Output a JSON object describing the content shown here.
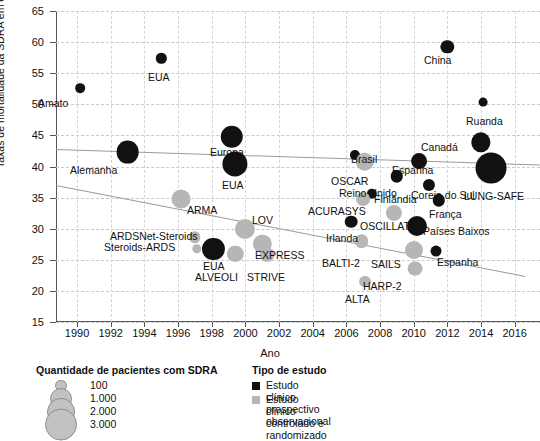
{
  "chart_data": {
    "type": "scatter",
    "title": "",
    "xlabel": "Ano",
    "ylabel": "Taxas de mortalidade da SDRA em estudos clínicos (%)",
    "xlim": [
      1988.75,
      2017.5
    ],
    "ylim": [
      15,
      65
    ],
    "xticks": [
      1990,
      1992,
      1994,
      1996,
      1998,
      2000,
      2002,
      2004,
      2006,
      2008,
      2010,
      2012,
      2014,
      2016
    ],
    "yticks": [
      15,
      20,
      25,
      30,
      35,
      40,
      45,
      50,
      55,
      60,
      65
    ],
    "grid": true,
    "legend_position": "below-plot",
    "size_encoding": "Quantidade de pacientes com SDRA",
    "series": [
      {
        "name": "Estudo clínico prospectivo observacional",
        "color": "#111111",
        "points": [
          {
            "label": "Amato",
            "x": 1990.2,
            "y": 52.6,
            "n": 90,
            "lx": 38,
            "ly": 97
          },
          {
            "label": "EUA",
            "x": 1995.0,
            "y": 57.4,
            "n": 120,
            "lx": 148,
            "ly": 71
          },
          {
            "label": "Alemanha",
            "x": 1993.0,
            "y": 42.3,
            "n": 1400,
            "lx": 70,
            "ly": 164
          },
          {
            "label": "Europa",
            "x": 1999.2,
            "y": 44.8,
            "n": 1350,
            "lx": 210,
            "ly": 146
          },
          {
            "label": "EUA",
            "x": 1999.4,
            "y": 40.4,
            "n": 1800,
            "lx": 222,
            "ly": 179
          },
          {
            "label": "EUA",
            "x": 1998.1,
            "y": 26.7,
            "n": 1300,
            "lx": 203,
            "ly": 260
          },
          {
            "label": "China",
            "x": 2012.0,
            "y": 59.2,
            "n": 300,
            "lx": 424,
            "ly": 54
          },
          {
            "label": "Ruanda",
            "x": 2014.1,
            "y": 50.4,
            "n": 60,
            "lx": 466,
            "ly": 115
          },
          {
            "label": "Canadá",
            "x": 2014.0,
            "y": 43.9,
            "n": 900,
            "lx": 421,
            "ly": 141
          },
          {
            "label": "Brasil",
            "x": 2006.5,
            "y": 41.9,
            "n": 110,
            "lx": 351,
            "ly": 153
          },
          {
            "label": "Espanha",
            "x": 2010.3,
            "y": 40.9,
            "n": 520,
            "lx": 392,
            "ly": 164
          },
          {
            "label": "Reino Unido",
            "x": 2009.0,
            "y": 38.4,
            "n": 240,
            "lx": 339,
            "ly": 187
          },
          {
            "label": "Coreia do Sul",
            "x": 2010.9,
            "y": 37.0,
            "n": 220,
            "lx": 411,
            "ly": 189
          },
          {
            "label": "LUNG-SAFE",
            "x": 2014.6,
            "y": 39.8,
            "n": 3000,
            "lx": 464,
            "ly": 190
          },
          {
            "label": "Finlândia",
            "x": 2007.5,
            "y": 35.6,
            "n": 120,
            "lx": 374,
            "ly": 193
          },
          {
            "label": "França",
            "x": 2011.5,
            "y": 34.6,
            "n": 240,
            "lx": 429,
            "ly": 208
          },
          {
            "label": "Irlanda",
            "x": 2006.3,
            "y": 31.1,
            "n": 250,
            "lx": 326,
            "ly": 232
          },
          {
            "label": "Países Baixos",
            "x": 2010.2,
            "y": 30.5,
            "n": 1000,
            "lx": 423,
            "ly": 225
          },
          {
            "label": "Espanha",
            "x": 2011.3,
            "y": 26.4,
            "n": 150,
            "lx": 437,
            "ly": 256
          }
        ]
      },
      {
        "name": "Estudo clínico controlado e randomizado",
        "color": "#b6b6b6",
        "points": [
          {
            "label": "ARMA",
            "x": 1996.2,
            "y": 34.8,
            "n": 860,
            "lx": 187,
            "ly": 204
          },
          {
            "label": "ARDSNet-Steroids",
            "x": 1997.0,
            "y": 28.6,
            "n": 180,
            "lx": 110,
            "ly": 230
          },
          {
            "label": "Steroids-ARDS",
            "x": 1997.1,
            "y": 26.8,
            "n": 80,
            "lx": 104,
            "ly": 241
          },
          {
            "label": "LOV",
            "x": 2000.0,
            "y": 30.0,
            "n": 1000,
            "lx": 252,
            "ly": 214
          },
          {
            "label": "ALVEOLI",
            "x": 1999.4,
            "y": 26.0,
            "n": 560,
            "lx": 195,
            "ly": 271
          },
          {
            "label": "EXPRESS",
            "x": 2001.0,
            "y": 27.6,
            "n": 780,
            "lx": 255,
            "ly": 249
          },
          {
            "label": "STRIVE",
            "x": 2001.3,
            "y": 25.8,
            "n": 400,
            "lx": 247,
            "ly": 271
          },
          {
            "label": "OSCAR",
            "x": 2007.1,
            "y": 40.8,
            "n": 800,
            "lx": 331,
            "ly": 175
          },
          {
            "label": "ACURASYS",
            "x": 2007.0,
            "y": 34.7,
            "n": 340,
            "lx": 308,
            "ly": 205
          },
          {
            "label": "OSCILLATE",
            "x": 2008.8,
            "y": 32.5,
            "n": 550,
            "lx": 360,
            "ly": 220
          },
          {
            "label": "BALTI-2",
            "x": 2006.9,
            "y": 28.0,
            "n": 330,
            "lx": 322,
            "ly": 257
          },
          {
            "label": "SAILS",
            "x": 2010.0,
            "y": 26.5,
            "n": 740,
            "lx": 371,
            "ly": 258
          },
          {
            "label": "HARP-2",
            "x": 2010.1,
            "y": 23.6,
            "n": 420,
            "lx": 363,
            "ly": 280
          },
          {
            "label": "ALTA",
            "x": 2007.1,
            "y": 21.5,
            "n": 200,
            "lx": 345,
            "ly": 293
          }
        ]
      }
    ],
    "trend_lines": [
      {
        "name": "observational-trend",
        "x1": 1988.75,
        "y1": 42.8,
        "x2": 2017.5,
        "y2": 40.3
      },
      {
        "name": "rct-trend",
        "x1": 1988.75,
        "y1": 37.0,
        "x2": 2016.6,
        "y2": 22.4
      }
    ]
  },
  "axes": {
    "x_title": "Ano",
    "y_title": "Taxas de mortalidade da SDRA em estudos clínicos (%)",
    "x_ticks": [
      "1990",
      "1992",
      "1994",
      "1996",
      "1998",
      "2000",
      "2002",
      "2004",
      "2006",
      "2008",
      "2010",
      "2012",
      "2014",
      "2016"
    ],
    "y_ticks": [
      "15",
      "20",
      "25",
      "30",
      "35",
      "40",
      "45",
      "50",
      "55",
      "60",
      "65"
    ]
  },
  "legend_size": {
    "title": "Quantidade de pacientes com SDRA",
    "items": [
      {
        "label": "100",
        "value": 100
      },
      {
        "label": "1.000",
        "value": 1000
      },
      {
        "label": "2.000",
        "value": 2000
      },
      {
        "label": "3.000",
        "value": 3000
      }
    ]
  },
  "legend_type": {
    "title": "Tipo de estudo",
    "items": [
      {
        "label": "Estudo clínico prospectivo observacional",
        "color": "#111111",
        "key": "obs"
      },
      {
        "label": "Estudo clínico controlado e randomizado",
        "color": "#b6b6b6",
        "key": "rct"
      }
    ]
  },
  "colors": {
    "observational": "#111111",
    "randomized": "#b6b6b6",
    "trend": "#9a9a9a",
    "grid": "#cccccc",
    "axis": "#555555"
  }
}
